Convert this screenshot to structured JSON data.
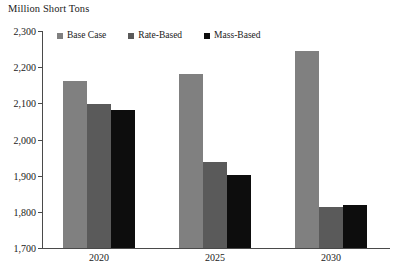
{
  "chart_data": {
    "type": "bar",
    "title": "",
    "ylabel": "Million Short Tons",
    "xlabel": "",
    "categories": [
      "2020",
      "2025",
      "2030"
    ],
    "series": [
      {
        "name": "Base Case",
        "color": "#808080",
        "values": [
          2161,
          2180,
          2244
        ]
      },
      {
        "name": "Rate-Based",
        "color": "#5a5a5a",
        "values": [
          2098,
          1938,
          1813
        ]
      },
      {
        "name": "Mass-Based",
        "color": "#0d0d0d",
        "values": [
          2081,
          1902,
          1819
        ]
      }
    ],
    "ylim": [
      1700,
      2300
    ],
    "ytick_labels": [
      "2,300",
      "2,200",
      "2,100",
      "2,000",
      "1,900",
      "1,800",
      "1,700"
    ],
    "ytick_values": [
      2300,
      2200,
      2100,
      2000,
      1900,
      1800,
      1700
    ],
    "grid": false,
    "legend_position": "top-left-inside",
    "axis_color": "#4a4a4a"
  },
  "axis": {
    "y_title": "Million Short Tons"
  },
  "legend": {
    "items": [
      {
        "label": "Base Case"
      },
      {
        "label": "Rate-Based"
      },
      {
        "label": "Mass-Based"
      }
    ]
  }
}
